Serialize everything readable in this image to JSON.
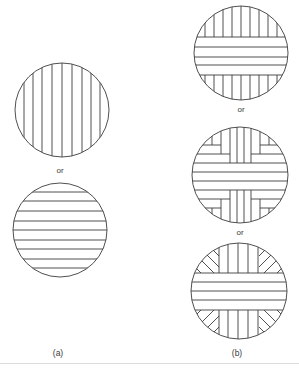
{
  "figure": {
    "columns": [
      {
        "id": "a",
        "caption": "(a)",
        "items": [
          {
            "pattern": "vertical-lines"
          },
          {
            "separator": "or"
          },
          {
            "pattern": "horizontal-lines"
          }
        ]
      },
      {
        "id": "b",
        "caption": "(b)",
        "items": [
          {
            "pattern": "horizontal-band-with-vertical-caps"
          },
          {
            "separator": "or"
          },
          {
            "pattern": "cross-with-nested-corners"
          },
          {
            "separator": "or"
          },
          {
            "pattern": "horizontal-band-with-radial-caps"
          }
        ]
      }
    ],
    "labels": {
      "or_a": "or",
      "or_b1": "or",
      "or_b2": "or",
      "caption_a": "(a)",
      "caption_b": "(b)"
    },
    "colors": {
      "line": "#3c3c3c",
      "background": "#ffffff"
    }
  }
}
